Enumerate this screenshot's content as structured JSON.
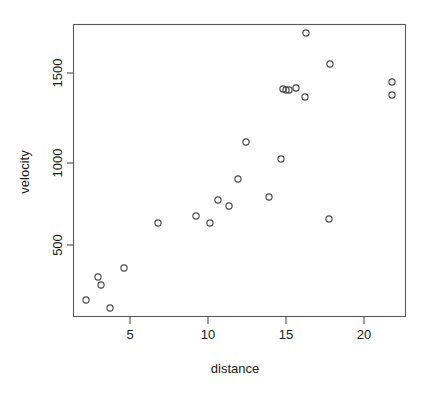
{
  "chart_data": {
    "type": "scatter",
    "title": "",
    "xlabel": "distance",
    "ylabel": "velocity",
    "xlim": [
      1.0,
      22.8
    ],
    "ylim": [
      120,
      1830
    ],
    "grid": false,
    "legend": null,
    "xticks": [
      5,
      10,
      15,
      20
    ],
    "xtick_labels": [
      "5",
      "10",
      "15",
      "20"
    ],
    "yticks": [
      500,
      1000,
      1500
    ],
    "ytick_labels": [
      "500",
      "1000",
      "1500"
    ],
    "marker": "open-circle",
    "marker_color": "#4a4a4a",
    "n_points": 24,
    "x": [
      2.0,
      9.16,
      16.14,
      2.76,
      15.1,
      21.0,
      11.75,
      2.0,
      21.8,
      10.0,
      11.1,
      9.0,
      11.5,
      10.5,
      9.5,
      15.0,
      12.2,
      13.8,
      17.8,
      6.6,
      3.0,
      17.3,
      3.5,
      14.8
    ],
    "y": [
      133,
      664,
      1794,
      319,
      1415,
      1483,
      890,
      179,
      1417,
      650,
      723,
      666,
      1112,
      760,
      621,
      1429,
      1110,
      776,
      1603,
      619,
      290,
      635,
      164,
      1434
    ],
    "points": [
      {
        "x": 2.0,
        "y": 179,
        "px": 86,
        "py": 300
      },
      {
        "x": 2.8,
        "y": 318,
        "px": 98,
        "py": 277
      },
      {
        "x": 3.0,
        "y": 290,
        "px": 101,
        "py": 285
      },
      {
        "x": 3.5,
        "y": 145,
        "px": 110,
        "py": 308
      },
      {
        "x": 4.4,
        "y": 350,
        "px": 124,
        "py": 268
      },
      {
        "x": 6.6,
        "y": 619,
        "px": 158,
        "py": 223
      },
      {
        "x": 9.1,
        "y": 664,
        "px": 196,
        "py": 216
      },
      {
        "x": 10.0,
        "y": 621,
        "px": 210,
        "py": 223
      },
      {
        "x": 10.5,
        "y": 760,
        "px": 218,
        "py": 200
      },
      {
        "x": 11.2,
        "y": 723,
        "px": 229,
        "py": 206
      },
      {
        "x": 11.8,
        "y": 890,
        "px": 238,
        "py": 179
      },
      {
        "x": 12.3,
        "y": 1110,
        "px": 246,
        "py": 142
      },
      {
        "x": 13.8,
        "y": 776,
        "px": 269,
        "py": 197
      },
      {
        "x": 14.6,
        "y": 1010,
        "px": 281,
        "py": 159
      },
      {
        "x": 14.8,
        "y": 1434,
        "px": 283,
        "py": 89
      },
      {
        "x": 14.9,
        "y": 1430,
        "px": 286,
        "py": 90
      },
      {
        "x": 15.1,
        "y": 1432,
        "px": 289,
        "py": 90
      },
      {
        "x": 15.6,
        "y": 1440,
        "px": 296,
        "py": 88
      },
      {
        "x": 16.1,
        "y": 1394,
        "px": 305,
        "py": 97
      },
      {
        "x": 16.2,
        "y": 1794,
        "px": 306,
        "py": 33
      },
      {
        "x": 17.3,
        "y": 634,
        "px": 329,
        "py": 219
      },
      {
        "x": 17.8,
        "y": 1603,
        "px": 330,
        "py": 64
      },
      {
        "x": 21.7,
        "y": 1483,
        "px": 392,
        "py": 82
      },
      {
        "x": 21.8,
        "y": 1417,
        "px": 392,
        "py": 95
      }
    ]
  },
  "plot": {
    "box": {
      "left": 73,
      "top": 24,
      "right": 406,
      "bottom": 317
    },
    "axis_title_x": "distance",
    "axis_title_y": "velocity"
  }
}
